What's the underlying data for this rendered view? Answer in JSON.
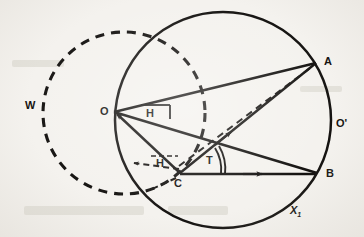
{
  "figure": {
    "background_color": "#f4f2ee",
    "ink_color": "#141210",
    "width": 364,
    "height": 237
  },
  "labels": {
    "point_a": "A",
    "point_b": "B",
    "point_c": "C",
    "point_o": "O",
    "point_o_prime": "O'",
    "circle_w": "W",
    "angle_h_upper": "H",
    "angle_h_lower": "H",
    "angle_t": "T",
    "arc_x1": "X",
    "arc_x1_sub": "1"
  },
  "geometry": {
    "main_circle": {
      "cx": 223,
      "cy": 120,
      "r": 108,
      "style": "solid",
      "name": "circle-O-prime"
    },
    "dashed_circle": {
      "cx": 124,
      "cy": 113,
      "r": 81,
      "style": "dashed",
      "name": "circle-W"
    },
    "points": {
      "A": {
        "x": 316,
        "y": 63
      },
      "B": {
        "x": 317,
        "y": 173
      },
      "C": {
        "x": 180,
        "y": 173
      },
      "O": {
        "x": 114,
        "y": 112
      }
    },
    "segments": [
      {
        "name": "segment-O-A",
        "from": "O",
        "to": "A",
        "style": "solid"
      },
      {
        "name": "segment-O-B",
        "from": "O",
        "to": "B",
        "style": "solid"
      },
      {
        "name": "segment-C-O",
        "from": "C",
        "to": "O",
        "style": "solid",
        "arrow": "toward-O"
      },
      {
        "name": "segment-C-A",
        "from": "C",
        "to": "A",
        "style": "solid",
        "arrow": "toward-A"
      },
      {
        "name": "segment-C-B",
        "from": "C",
        "to": "B",
        "style": "solid",
        "arrow": "toward-B"
      },
      {
        "name": "segment-C-A-dashed",
        "from": "C",
        "to": "A",
        "style": "dashed"
      },
      {
        "name": "segment-C-left-dashed",
        "from": "C",
        "to": "left",
        "style": "dashed",
        "arrow": "toward-left"
      }
    ],
    "angle_markers": [
      {
        "name": "angle-marker-H-at-O",
        "type": "bracket",
        "at": "O"
      },
      {
        "name": "angle-marker-H-at-C",
        "type": "bracket",
        "at": "C"
      },
      {
        "name": "angle-marker-T-at-C",
        "type": "double-arc",
        "at": "C"
      }
    ]
  }
}
